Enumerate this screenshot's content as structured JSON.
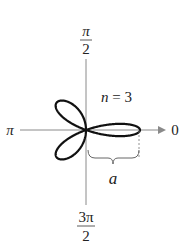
{
  "diagram": {
    "type": "polar-rose",
    "equation_label": "n = 3",
    "n_label": "n",
    "n_equals": "= 3",
    "petals": 3,
    "axis_labels": {
      "top_num": "π",
      "top_den": "2",
      "bottom_num": "3π",
      "bottom_den": "2",
      "left": "π",
      "right": "0"
    },
    "length_label": "a",
    "colors": {
      "curve": "#111111",
      "axis": "#888888"
    }
  }
}
